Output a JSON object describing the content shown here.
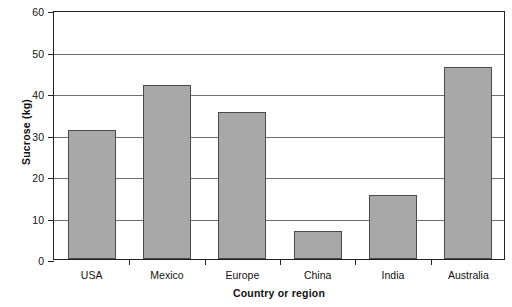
{
  "chart_data": {
    "type": "bar",
    "title": "",
    "xlabel": "Country or region",
    "ylabel": "Sucrose (kg)",
    "categories": [
      "USA",
      "Mexico",
      "Europe",
      "China",
      "India",
      "Australia"
    ],
    "values": [
      31,
      42,
      35.5,
      6.8,
      15.4,
      46.3
    ],
    "ylim": [
      0,
      60
    ],
    "yticks": [
      0,
      10,
      20,
      30,
      40,
      50,
      60
    ],
    "ytick_labels": [
      "0",
      "10",
      "20",
      "30",
      "40",
      "50",
      "60"
    ],
    "grid": true,
    "grid_axis": "y",
    "legend": false,
    "legend_position": "none",
    "bar_fill_color": "#a8a8a8",
    "bar_edge_color": "#4a4a4a",
    "axis_color": "#222222",
    "gridline_color": "#6f6f6f",
    "background_color": "#ffffff"
  }
}
